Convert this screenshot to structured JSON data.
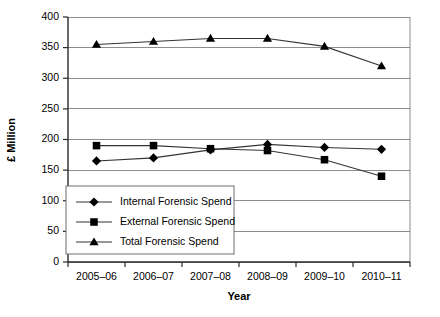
{
  "chart_data": {
    "type": "line",
    "title": "",
    "xlabel": "Year",
    "ylabel": "£ Million",
    "categories": [
      "2005–06",
      "2006–07",
      "2007–08",
      "2008–09",
      "2009–10",
      "2010–11"
    ],
    "ylim": [
      0,
      400
    ],
    "yticks": [
      0,
      50,
      100,
      150,
      200,
      250,
      300,
      350,
      400
    ],
    "ytick_labels": [
      "0",
      "50",
      "100",
      "150",
      "200",
      "250",
      "300",
      "350",
      "400"
    ],
    "grid": true,
    "legend_position": "lower-left-inside",
    "series": [
      {
        "name": "Internal Forensic Spend",
        "marker": "diamond",
        "color": "#000000",
        "values": [
          165,
          170,
          183,
          192,
          187,
          184
        ]
      },
      {
        "name": "External Forensic Spend",
        "marker": "square",
        "color": "#000000",
        "values": [
          190,
          190,
          185,
          182,
          167,
          140
        ]
      },
      {
        "name": "Total Forensic Spend",
        "marker": "triangle",
        "color": "#000000",
        "values": [
          355,
          360,
          365,
          365,
          352,
          320
        ]
      }
    ]
  }
}
